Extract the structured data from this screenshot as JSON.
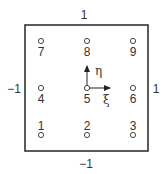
{
  "diagram": {
    "type": "nine-node quadrilateral element (natural coordinates)",
    "boundary_labels": {
      "top": "1",
      "bottom": "−1",
      "left": "−1",
      "right": "1"
    },
    "axes": {
      "xi": "ξ",
      "eta": "η"
    },
    "nodes": [
      {
        "id": "1",
        "xi": -1,
        "eta": -1
      },
      {
        "id": "2",
        "xi": 0,
        "eta": -1
      },
      {
        "id": "3",
        "xi": 1,
        "eta": -1
      },
      {
        "id": "4",
        "xi": -1,
        "eta": 0
      },
      {
        "id": "5",
        "xi": 0,
        "eta": 0
      },
      {
        "id": "6",
        "xi": 1,
        "eta": 0
      },
      {
        "id": "7",
        "xi": -1,
        "eta": 1
      },
      {
        "id": "8",
        "xi": 0,
        "eta": 1
      },
      {
        "id": "9",
        "xi": 1,
        "eta": 1
      }
    ],
    "colors": {
      "stroke": "#333333",
      "background": "#ffffff"
    }
  }
}
